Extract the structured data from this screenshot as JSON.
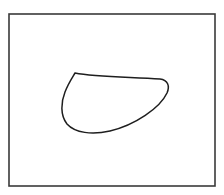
{
  "diagram": {
    "background": "#ffffff",
    "frame": {
      "x": 9,
      "y": 14,
      "width": 206,
      "height": 172,
      "stroke": "#3a3a3a",
      "stroke_width": 1.6
    },
    "shape": {
      "type": "closed-curve",
      "stroke": "#1e1e1e",
      "stroke_width": 1.5,
      "fill": "none",
      "path": "M75,73 C95,77 130,77 160,79 C168,80 170,86 167,93 C160,108 135,125 110,131 C92,135 75,133 67,124 C60,115 61,102 65,92 C68,84 72,78 75,73 Z"
    }
  }
}
